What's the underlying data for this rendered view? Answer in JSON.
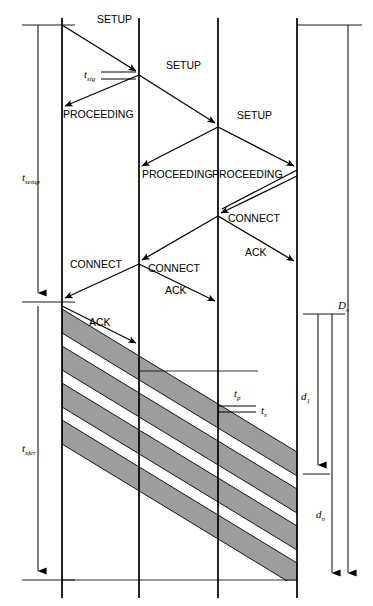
{
  "figure": {
    "type": "sequence-timing-diagram",
    "background_color": "#ffffff",
    "line_color": "#000000",
    "band_fill_color": "#9d9d9d",
    "width": 373,
    "height": 606
  },
  "timelines": [
    {
      "id": "node-1",
      "x": 62
    },
    {
      "id": "node-2",
      "x": 139
    },
    {
      "id": "node-3",
      "x": 218
    },
    {
      "id": "node-4",
      "x": 297
    }
  ],
  "messages": [
    {
      "id": "setup-1",
      "label": "SETUP",
      "from": "node-1",
      "to": "node-2",
      "direction": "right",
      "label_x": 97,
      "label_y": 23,
      "x1": 62,
      "y1": 25,
      "x2": 139,
      "y2": 73
    },
    {
      "id": "proceeding-1",
      "label": "PROCEEDING",
      "from": "node-2",
      "to": "node-1",
      "direction": "left",
      "label_x": 63,
      "label_y": 118,
      "x1": 139,
      "y1": 75,
      "x2": 62,
      "y2": 108
    },
    {
      "id": "setup-2",
      "label": "SETUP",
      "from": "node-2",
      "to": "node-3",
      "direction": "right",
      "label_x": 166,
      "label_y": 69,
      "x1": 139,
      "y1": 75,
      "x2": 218,
      "y2": 125
    },
    {
      "id": "proceeding-2",
      "label": "PROCEEDING",
      "from": "node-3",
      "to": "node-2",
      "direction": "left",
      "label_x": 142,
      "label_y": 178,
      "x1": 218,
      "y1": 127,
      "x2": 139,
      "y2": 168
    },
    {
      "id": "setup-3",
      "label": "SETUP",
      "from": "node-3",
      "to": "node-4",
      "direction": "right",
      "label_x": 237,
      "label_y": 119,
      "x1": 218,
      "y1": 127,
      "x2": 297,
      "y2": 168
    },
    {
      "id": "proceeding-3",
      "label": "PROCEEDING",
      "from": "node-4",
      "to": "node-3",
      "direction": "left",
      "label_x": 212,
      "label_y": 178,
      "x1": 297,
      "y1": 170,
      "x2": 218,
      "y2": 211
    },
    {
      "id": "connect-1",
      "label": "CONNECT",
      "from": "node-4",
      "to": "node-3",
      "direction": "left",
      "label_x": 228,
      "label_y": 222,
      "x1": 297,
      "y1": 176,
      "x2": 218,
      "y2": 214
    },
    {
      "id": "ack-1",
      "label": "ACK",
      "from": "node-3",
      "to": "node-4",
      "direction": "right",
      "label_x": 245,
      "label_y": 256,
      "x1": 218,
      "y1": 216,
      "x2": 297,
      "y2": 263
    },
    {
      "id": "connect-2",
      "label": "CONNECT",
      "from": "node-3",
      "to": "node-2",
      "direction": "left",
      "label_x": 148,
      "label_y": 272,
      "x1": 218,
      "y1": 216,
      "x2": 139,
      "y2": 262
    },
    {
      "id": "ack-2",
      "label": "ACK",
      "from": "node-2",
      "to": "node-3",
      "direction": "right",
      "label_x": 165,
      "label_y": 294,
      "x1": 139,
      "y1": 264,
      "x2": 218,
      "y2": 303
    },
    {
      "id": "connect-3",
      "label": "CONNECT",
      "from": "node-2",
      "to": "node-1",
      "direction": "left",
      "label_x": 70,
      "label_y": 268,
      "x1": 139,
      "y1": 264,
      "x2": 62,
      "y2": 300
    },
    {
      "id": "ack-3",
      "label": "ACK",
      "from": "node-1",
      "to": "node-2",
      "direction": "right",
      "label_x": 89,
      "label_y": 326,
      "x1": 62,
      "y1": 305,
      "x2": 139,
      "y2": 345
    }
  ],
  "timing_labels": {
    "t_sig": {
      "base": "t",
      "sub": "sig",
      "x": 84,
      "y": 78
    },
    "t_setup": {
      "base": "t",
      "sub": "setup",
      "x": 22,
      "y": 181
    },
    "t_xfer": {
      "base": "t",
      "sub": "xfer",
      "x": 22,
      "y": 452
    },
    "t_p": {
      "base": "t",
      "sub": "p",
      "x": 234,
      "y": 397
    },
    "t_s": {
      "base": "t",
      "sub": "s",
      "x": 261,
      "y": 414
    },
    "D_s": {
      "base": "D",
      "sub": "s",
      "x": 340,
      "y": 309
    },
    "d_1": {
      "base": "d",
      "sub": "1",
      "x": 302,
      "y": 400
    },
    "d_n": {
      "base": "d",
      "sub": "n",
      "x": 317,
      "y": 518
    }
  },
  "measure_bars": [
    {
      "id": "t-setup-bar",
      "x": 38,
      "y_top": 25,
      "y_bottom": 302,
      "tick_top_x1": 22,
      "tick_top_x2": 75,
      "tick_bottom_x1": 22,
      "tick_bottom_x2": 75,
      "arrow": "down"
    },
    {
      "id": "t-xfer-bar",
      "x": 38,
      "y_top": 302,
      "y_bottom": 580,
      "tick_top_x1": 22,
      "tick_top_x2": 75,
      "tick_bottom_x1": 22,
      "tick_bottom_x2": 75,
      "arrow": "down"
    },
    {
      "id": "d-1-bar",
      "x": 318,
      "y_top": 314,
      "y_bottom": 474,
      "tick_top_x1": 303,
      "tick_top_x2": 345,
      "tick_bottom_x1": 303,
      "tick_bottom_x2": 330,
      "arrow": "down"
    },
    {
      "id": "d-n-bar",
      "x": 332,
      "y_top": 314,
      "y_bottom": 582,
      "tick_top_x1": 303,
      "tick_top_x2": 345,
      "tick_bottom_x1": 0,
      "tick_bottom_x2": 0,
      "arrow": "down"
    },
    {
      "id": "D-s-bar",
      "x": 348,
      "y_top": 25,
      "y_bottom": 582,
      "tick_top_x1": 297,
      "tick_top_x2": 362,
      "tick_bottom_x1": 0,
      "tick_bottom_x2": 0,
      "arrow": "down"
    }
  ],
  "bands": {
    "count": 4,
    "description": "Gray diagonal data transfer bands sweeping from node-1 down to node-4",
    "fill": "#9d9d9d",
    "stroke": "#000000"
  },
  "baseline_ticks": [
    {
      "id": "bottom-rule-1",
      "x1": 62,
      "x2": 139,
      "y": 580
    },
    {
      "id": "bottom-rule-2",
      "x1": 139,
      "x2": 218,
      "y": 580
    },
    {
      "id": "bottom-rule-3",
      "x1": 218,
      "x2": 297,
      "y": 580
    },
    {
      "id": "mid-rule-1",
      "x1": 139,
      "x2": 218,
      "y": 371
    },
    {
      "id": "mid-rule-2",
      "x1": 218,
      "x2": 258,
      "y": 371
    }
  ]
}
